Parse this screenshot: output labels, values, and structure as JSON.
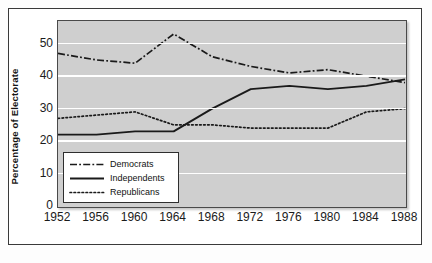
{
  "figure": {
    "y_axis_title": "Percentage of Electorate"
  },
  "legend": {
    "items": [
      {
        "label": "Democrats",
        "style": "dash-dot",
        "icon": "dash-dot-line-icon"
      },
      {
        "label": "Independents",
        "style": "solid",
        "icon": "solid-line-icon"
      },
      {
        "label": "Republicans",
        "style": "dotted",
        "icon": "dotted-line-icon"
      }
    ]
  },
  "chart_data": {
    "type": "line",
    "title": "",
    "xlabel": "",
    "ylabel": "Percentage of Electorate",
    "x": [
      1952,
      1956,
      1960,
      1964,
      1968,
      1972,
      1976,
      1980,
      1984,
      1988
    ],
    "categories": [
      "1952",
      "1956",
      "1960",
      "1964",
      "1968",
      "1972",
      "1976",
      "1980",
      "1984",
      "1988"
    ],
    "xlim": [
      1952,
      1988
    ],
    "ylim": [
      0,
      57
    ],
    "yticks": [
      0,
      10,
      20,
      30,
      40,
      50
    ],
    "ytick_labels": [
      "0",
      "10",
      "20",
      "30",
      "40",
      "50"
    ],
    "grid": "horizontal-white-gridlines",
    "legend_position": "lower-left-inside",
    "plot_background": "#cfcfcf",
    "line_color": "#1a1a1a",
    "series": [
      {
        "name": "Democrats",
        "style": "dash-dot",
        "values": [
          47,
          45,
          44,
          53,
          46,
          43,
          41,
          42,
          40,
          38
        ]
      },
      {
        "name": "Independents",
        "style": "solid",
        "values": [
          22,
          22,
          23,
          23,
          30,
          36,
          37,
          36,
          37,
          39
        ]
      },
      {
        "name": "Republicans",
        "style": "dotted",
        "values": [
          27,
          28,
          29,
          25,
          25,
          24,
          24,
          24,
          29,
          30
        ]
      }
    ]
  }
}
